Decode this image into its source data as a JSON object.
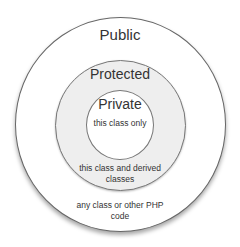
{
  "diagram": {
    "type": "concentric-circles",
    "topic": "PHP visibility scopes",
    "colors": {
      "outer_fill": "#ffffff",
      "middle_fill": "#eeeeee",
      "inner_fill": "#ffffff",
      "stroke": "#666666",
      "text": "#333333"
    },
    "rings": [
      {
        "title": "Public",
        "description_line1": "any class or other PHP",
        "description_line2": "code"
      },
      {
        "title": "Protected",
        "description_line1": "this class and derived",
        "description_line2": "classes"
      },
      {
        "title": "Private",
        "description_line1": "this class only"
      }
    ]
  }
}
